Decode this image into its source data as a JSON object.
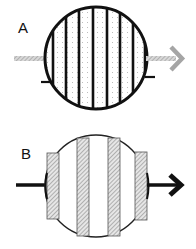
{
  "panels": [
    {
      "label": "A",
      "description": "Circle with vertical black stripes on dotted background, gray hatched arrow passing through"
    },
    {
      "label": "B",
      "description": "Circle with hatched vertical rectangular bars, black arrow passing through"
    }
  ],
  "colors": {
    "stroke": "#111111",
    "dots": "#b8b8b8",
    "hatch": "#888888",
    "hatch_bg": "#e4e4e4",
    "gray_arrow": "#a0a0a0"
  }
}
